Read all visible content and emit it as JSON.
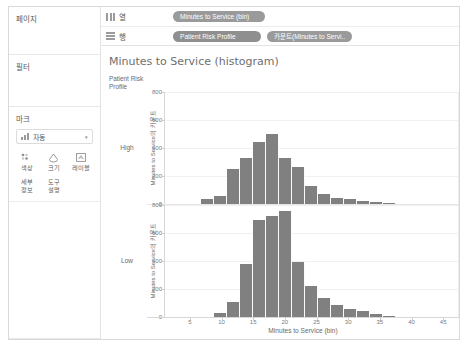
{
  "sidebar": {
    "pages": {
      "title": "페이지"
    },
    "filters": {
      "title": "필터"
    },
    "marks": {
      "title": "마크",
      "type_label": "자동",
      "caret": "▾",
      "buttons": [
        {
          "name": "color",
          "label": "색상"
        },
        {
          "name": "size",
          "label": "크기"
        },
        {
          "name": "label",
          "label": "레이블"
        },
        {
          "name": "detail",
          "label": "세부\n정보"
        },
        {
          "name": "tooltip",
          "label": "도구\n설명"
        }
      ],
      "detail_line1": "세부",
      "detail_line2": "정보",
      "tooltip_line1": "도구",
      "tooltip_line2": "설명"
    }
  },
  "shelves": {
    "columns": {
      "name": "열",
      "pills": [
        "Minutes to Service (bin)"
      ]
    },
    "rows": {
      "name": "행",
      "pills": [
        "Patient Risk Profile",
        "카운트(Minutes to Servi.."
      ]
    }
  },
  "view": {
    "title": "Minutes to Service (histogram)",
    "row_field_line1": "Patient Risk",
    "row_field_line2": "Profile",
    "row_headers": [
      "High",
      "Low"
    ]
  },
  "chart_data": {
    "type": "bar",
    "title": "Minutes to Service (histogram)",
    "xlabel": "Minutes to Service (bin)",
    "ylabel": "Minutes to Service의 카운트",
    "xlim": [
      2.5,
      47.5
    ],
    "ylim": [
      0,
      800
    ],
    "xticks": [
      5,
      10,
      15,
      20,
      25,
      30,
      35,
      40,
      45
    ],
    "yticks": [
      0,
      200,
      400,
      600,
      800
    ],
    "bin_width": 2,
    "grid": true,
    "legend": "none",
    "bar_color": "#808080",
    "panels": [
      {
        "name": "High",
        "bins": [
          9,
          11,
          13,
          15,
          17,
          19,
          21,
          23,
          25,
          27,
          29,
          31,
          33,
          35,
          37
        ],
        "values": [
          35,
          60,
          250,
          330,
          440,
          500,
          330,
          265,
          130,
          75,
          45,
          35,
          25,
          15,
          8
        ]
      },
      {
        "name": "Low",
        "bins": [
          11,
          13,
          15,
          17,
          19,
          21,
          23,
          25,
          27,
          29,
          31,
          33,
          35,
          37
        ],
        "values": [
          30,
          110,
          380,
          690,
          720,
          760,
          390,
          220,
          135,
          85,
          55,
          45,
          20,
          8
        ]
      }
    ]
  }
}
